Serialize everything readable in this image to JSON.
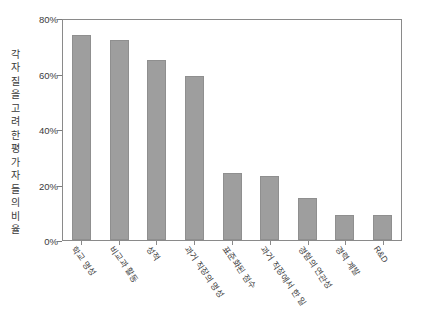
{
  "chart_data": {
    "type": "bar",
    "title": "",
    "subtitle": "",
    "xlabel": "",
    "ylabel": "각 자질을 고려한 평가자들의 비율",
    "ylim": [
      0,
      80
    ],
    "ytick_labels": [
      "80%",
      "60%",
      "40%",
      "20%",
      "0%"
    ],
    "ytick_values": [
      80,
      60,
      40,
      20,
      0
    ],
    "grid": false,
    "legend": null,
    "bar_color": "#9e9e9e",
    "categories": [
      "학교 명성",
      "비교과 활동",
      "성적",
      "과거 직장의 명성",
      "표준화된 점수",
      "과거 직장에서 한 일",
      "경험의 연관성",
      "경력 계발",
      "R&D"
    ],
    "values": [
      74,
      72,
      65,
      59,
      24,
      23,
      15,
      9,
      9
    ],
    "value_unit": "%"
  }
}
